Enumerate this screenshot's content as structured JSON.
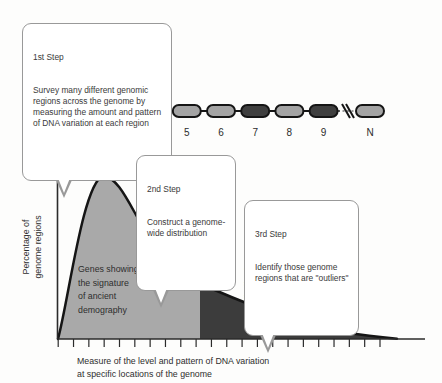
{
  "callouts": {
    "step1": {
      "title": "1st Step",
      "body": "Survey many different genomic\nregions across the genome by\nmeasuring the amount and pattern\nof DNA variation at each region"
    },
    "step2": {
      "title": "2nd Step",
      "body": "Construct a genome-\nwide distribution"
    },
    "step3": {
      "title": "3rd Step",
      "body": "Identify those genome\nregions that are \"outliers\""
    }
  },
  "chromosome": {
    "regions": [
      {
        "label": "1",
        "shade": "light"
      },
      {
        "label": "2",
        "shade": "light"
      },
      {
        "label": "3",
        "shade": "dark"
      },
      {
        "label": "4",
        "shade": "light"
      },
      {
        "label": "5",
        "shade": "light"
      },
      {
        "label": "6",
        "shade": "light"
      },
      {
        "label": "7",
        "shade": "dark"
      },
      {
        "label": "8",
        "shade": "light"
      },
      {
        "label": "9",
        "shade": "dark"
      },
      {
        "label": "N",
        "shade": "light",
        "after_break": true
      }
    ]
  },
  "plot": {
    "y_axis_label": "Percentage of\ngenome regions",
    "x_axis_label": "Measure of the level and pattern of DNA variation\nat specific locations of the genome",
    "demography_label": "Genes showing\nthe signature\nof ancient\ndemography",
    "selection_label": "Genes with a\nsignature of\nselection",
    "tick_count": 22
  },
  "colors": {
    "region_light": "#a4a4a4",
    "region_dark": "#3f3f3f",
    "region_outline": "#151515",
    "area_light": "#a9a9a9",
    "area_dark": "#3c3c3c",
    "curve_stroke": "#151515",
    "axis": "#2b2b2b",
    "callout_border": "#999999",
    "text": "#3a3a3a"
  }
}
